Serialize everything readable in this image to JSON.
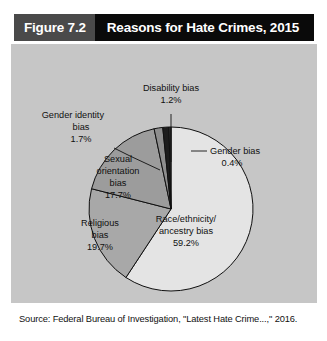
{
  "header": {
    "figure_label": "Figure 7.2",
    "title": "Reasons for Hate Crimes, 2015"
  },
  "source": {
    "text": "Source: Federal Bureau of Investigation, \"Latest Hate Crime...,\" 2016."
  },
  "colors": {
    "panel_background": "#c6c6c6",
    "header_figure_block": "#4a4a4a",
    "header_title_block": "#0a0a0a",
    "outline": "#101010",
    "page_background": "#ffffff"
  },
  "chart_data": {
    "type": "pie",
    "title": "Reasons for Hate Crimes, 2015",
    "subtitle": "",
    "xlabel": "",
    "ylabel": "",
    "units": "percent",
    "start_angle_deg": 0,
    "direction": "clockwise",
    "legend": "none",
    "grid": false,
    "total": 100.0,
    "categories": [
      "Race/ethnicity/ancestry bias",
      "Religious bias",
      "Sexual orientation bias",
      "Gender identity bias",
      "Disability bias",
      "Gender bias"
    ],
    "values": [
      59.2,
      19.7,
      17.7,
      1.7,
      1.2,
      0.4
    ],
    "slices": [
      {
        "label_lines": [
          "Race/ethnicity/",
          "ancestry bias"
        ],
        "value_label": "59.2%",
        "value": 59.2,
        "color": "#e4e4e4",
        "label_position": "inside"
      },
      {
        "label_lines": [
          "Religious",
          "bias"
        ],
        "value_label": "19.7%",
        "value": 19.7,
        "color": "#a8a8a8",
        "label_position": "inside"
      },
      {
        "label_lines": [
          "Sexual",
          "orientation",
          "bias"
        ],
        "value_label": "17.7%",
        "value": 17.7,
        "color": "#9c9c9c",
        "label_position": "inside"
      },
      {
        "label_lines": [
          "Gender identity",
          "bias"
        ],
        "value_label": "1.7%",
        "value": 1.7,
        "color": "#8e8e8e",
        "label_position": "outside-left"
      },
      {
        "label_lines": [
          "Disability bias"
        ],
        "value_label": "1.2%",
        "value": 1.2,
        "color": "#1c1c1c",
        "label_position": "outside-top"
      },
      {
        "label_lines": [
          "Gender bias"
        ],
        "value_label": "0.4%",
        "value": 0.4,
        "color": "#3a3a3a",
        "label_position": "outside-right"
      }
    ]
  },
  "labels": {
    "disability": {
      "line1": "Disability bias",
      "value": "1.2%"
    },
    "gender_identity": {
      "line1": "Gender identity",
      "line2": "bias",
      "value": "1.7%"
    },
    "gender": {
      "line1": "Gender bias",
      "value": "0.4%"
    },
    "sexual_orientation": {
      "line1": "Sexual",
      "line2": "orientation",
      "line3": "bias",
      "value": "17.7%"
    },
    "religious": {
      "line1": "Religious",
      "line2": "bias",
      "value": "19.7%"
    },
    "race": {
      "line1": "Race/ethnicity/",
      "line2": "ancestry bias",
      "value": "59.2%"
    }
  }
}
